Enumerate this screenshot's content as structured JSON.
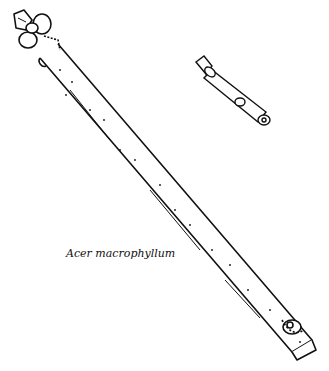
{
  "figure": {
    "caption": "Acer macrophyllum",
    "ink_color": "#111111",
    "background": "#ffffff",
    "elements": [
      "main-twig-with-terminal-bud-cluster",
      "small-twig-detail"
    ]
  }
}
